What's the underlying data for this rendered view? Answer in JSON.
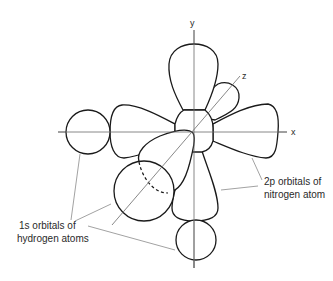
{
  "figure": {
    "axes": {
      "x_label": "x",
      "y_label": "y",
      "z_label": "z"
    },
    "labels": {
      "nitrogen_line1": "2p orbitals of",
      "nitrogen_line2": "nitrogen atom",
      "hydrogen_line1": "1s orbitals of",
      "hydrogen_line2": "hydrogen atoms"
    },
    "components": [
      {
        "name": "2p_x orbital",
        "type": "dumbbell lobe pair",
        "axis": "x"
      },
      {
        "name": "2p_y orbital",
        "type": "dumbbell lobe pair",
        "axis": "y"
      },
      {
        "name": "2p_z orbital",
        "type": "dumbbell lobe pair",
        "axis": "z"
      },
      {
        "name": "H 1s (on x-axis)",
        "type": "sphere",
        "position": "left, -x"
      },
      {
        "name": "H 1s (on y-axis)",
        "type": "sphere",
        "position": "bottom, -y"
      },
      {
        "name": "H 1s (on z-axis)",
        "type": "sphere",
        "position": "front, +z toward viewer"
      }
    ],
    "colors": {
      "line": "#1a1a1a",
      "axis": "#6a6a6a",
      "background": "#ffffff"
    }
  }
}
